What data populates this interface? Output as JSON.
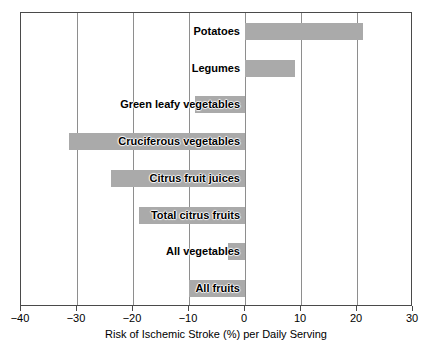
{
  "chart_data": {
    "type": "bar",
    "orientation": "horizontal",
    "title": "",
    "xlabel": "Risk of Ischemic Stroke (%) per Daily Serving",
    "ylabel": "",
    "xlim": [
      -40,
      30
    ],
    "xticks": [
      -40,
      -30,
      -20,
      -10,
      0,
      10,
      20,
      30
    ],
    "xtick_labels": [
      "−40",
      "−30",
      "−20",
      "−10",
      "0",
      "10",
      "20",
      "30"
    ],
    "grid": true,
    "legend": null,
    "categories": [
      "Potatoes",
      "Legumes",
      "Green leafy vegetables",
      "Cruciferous vegetables",
      "Citrus fruit juices",
      "Total citrus fruits",
      "All vegetables",
      "All fruits"
    ],
    "values": [
      21,
      9,
      -9,
      -31.5,
      -24,
      -19,
      -3,
      -10
    ],
    "bar_color": "#aaaaaa",
    "frame_color": "#4a4a4a",
    "background_color": "#ffffff"
  },
  "axis": {
    "x_title": "Risk of Ischemic Stroke (%) per Daily Serving"
  },
  "bars": [
    {
      "label": "Potatoes",
      "value": 21
    },
    {
      "label": "Legumes",
      "value": 9
    },
    {
      "label": "Green leafy vegetables",
      "value": -9
    },
    {
      "label": "Cruciferous vegetables",
      "value": -31.5
    },
    {
      "label": "Citrus fruit juices",
      "value": -24
    },
    {
      "label": "Total citrus fruits",
      "value": -19
    },
    {
      "label": "All vegetables",
      "value": -3
    },
    {
      "label": "All fruits",
      "value": -10
    }
  ],
  "ticks": [
    {
      "value": -40,
      "label": "−40"
    },
    {
      "value": -30,
      "label": "−30"
    },
    {
      "value": -20,
      "label": "−20"
    },
    {
      "value": -10,
      "label": "−10"
    },
    {
      "value": 0,
      "label": "0"
    },
    {
      "value": 10,
      "label": "10"
    },
    {
      "value": 20,
      "label": "20"
    },
    {
      "value": 30,
      "label": "30"
    }
  ]
}
